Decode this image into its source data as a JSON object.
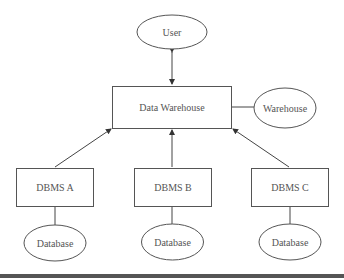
{
  "diagram": {
    "type": "data-warehouse-architecture",
    "nodes": {
      "user": {
        "label": "User",
        "shape": "ellipse"
      },
      "data_warehouse": {
        "label": "Data Warehouse",
        "shape": "rectangle"
      },
      "warehouse": {
        "label": "Warehouse",
        "shape": "ellipse"
      },
      "dbms_a": {
        "label": "DBMS A",
        "shape": "rectangle"
      },
      "dbms_b": {
        "label": "DBMS B",
        "shape": "rectangle"
      },
      "dbms_c": {
        "label": "DBMS C",
        "shape": "rectangle"
      },
      "db_a": {
        "label": "Database",
        "shape": "ellipse"
      },
      "db_b": {
        "label": "Database",
        "shape": "ellipse"
      },
      "db_c": {
        "label": "Database",
        "shape": "ellipse"
      }
    },
    "edges": [
      {
        "from": "user",
        "to": "data_warehouse",
        "arrow": "both"
      },
      {
        "from": "data_warehouse",
        "to": "warehouse",
        "arrow": "none"
      },
      {
        "from": "dbms_a",
        "to": "data_warehouse",
        "arrow": "forward"
      },
      {
        "from": "dbms_b",
        "to": "data_warehouse",
        "arrow": "forward"
      },
      {
        "from": "dbms_c",
        "to": "data_warehouse",
        "arrow": "forward"
      },
      {
        "from": "dbms_a",
        "to": "db_a",
        "arrow": "none"
      },
      {
        "from": "dbms_b",
        "to": "db_b",
        "arrow": "none"
      },
      {
        "from": "dbms_c",
        "to": "db_c",
        "arrow": "none"
      }
    ],
    "colors": {
      "stroke": "#555555",
      "text": "#555555",
      "bottom_rule": "#555555"
    }
  }
}
